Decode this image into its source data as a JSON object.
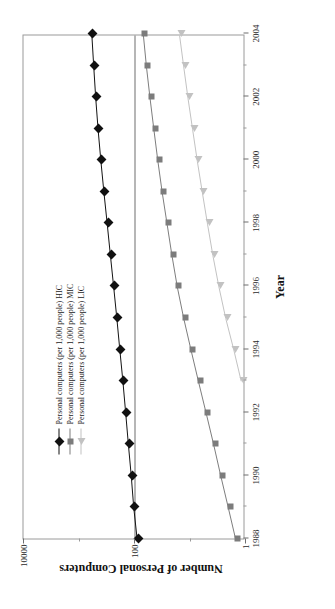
{
  "chart_data": {
    "type": "line",
    "title": "",
    "xlabel": "Year",
    "ylabel": "Number of Personal Computers",
    "yscale": "log",
    "ylim": [
      1,
      10000
    ],
    "ytick_labels": [
      "1",
      "100",
      "10000"
    ],
    "ytick_values": [
      1,
      100,
      10000
    ],
    "xlim": [
      1988,
      2004
    ],
    "xtick_labels": [
      "1988",
      "1990",
      "1992",
      "1994",
      "1996",
      "1998",
      "2000",
      "2002",
      "2004"
    ],
    "xtick_values": [
      1988,
      1990,
      1992,
      1994,
      1996,
      1998,
      2000,
      2002,
      2004
    ],
    "grid": false,
    "legend_position": "top-left-inside",
    "x": [
      1988,
      1989,
      1990,
      1991,
      1992,
      1993,
      1994,
      1995,
      1996,
      1997,
      1998,
      1999,
      2000,
      2001,
      2002,
      2003,
      2004
    ],
    "series": [
      {
        "name": "Personal computers (per 1,000 people) HIC",
        "marker": "diamond",
        "color": "#111111",
        "values": [
          86,
          99,
          110,
          124,
          139,
          156,
          177,
          201,
          229,
          263,
          300,
          345,
          392,
          440,
          485,
          528,
          570
        ]
      },
      {
        "name": "Personal computers (per 1,000 people) MIC",
        "marker": "square",
        "color": "#7c7c7c",
        "values": [
          1.4,
          1.9,
          2.6,
          3.5,
          4.8,
          6.6,
          9.0,
          12.2,
          16.0,
          20.0,
          24.5,
          30.0,
          36.0,
          42.5,
          50.0,
          58.0,
          66.0
        ]
      },
      {
        "name": "Personal computers (per 1,000 people) LIC",
        "marker": "triangle",
        "color": "#c2c2c2",
        "values": [
          null,
          null,
          null,
          null,
          null,
          1.1,
          1.5,
          2.1,
          2.8,
          3.6,
          4.5,
          5.6,
          6.9,
          8.4,
          10.2,
          12.2,
          14.5
        ]
      }
    ]
  },
  "axes": {
    "x_title": "Year",
    "y_title": "Number of Personal Computers"
  },
  "legend": {
    "items": [
      {
        "label": "Personal computers (per 1,000 people) HIC",
        "marker": "diamond-marker-icon",
        "color": "#111111"
      },
      {
        "label": "Personal computers (per 1,000 people) MIC",
        "marker": "square-marker-icon",
        "color": "#7c7c7c"
      },
      {
        "label": "Personal computers (per 1,000 people) LIC",
        "marker": "triangle-marker-icon",
        "color": "#c2c2c2"
      }
    ]
  },
  "colors": {
    "hic": "#111111",
    "mic": "#7c7c7c",
    "lic": "#c2c2c2",
    "axis": "#6f6f6f",
    "background": "#ffffff"
  }
}
